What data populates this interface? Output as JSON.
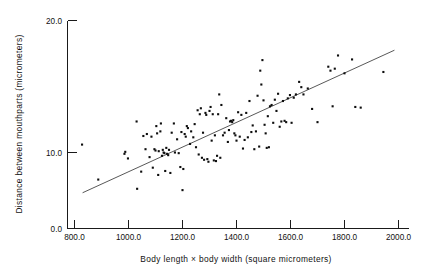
{
  "chart_data": {
    "type": "scatter",
    "title": "",
    "xlabel": "Body length × body width  (square micrometers)",
    "ylabel": "Distance between  mouthparts (micrometers)",
    "xlim": [
      740,
      2060
    ],
    "ylim": [
      0.0,
      20.0
    ],
    "grid": false,
    "legend": null,
    "xticks": [
      800.0,
      1000.0,
      1200.0,
      1400.0,
      1600.0,
      1800.0,
      2000.0
    ],
    "xtick_labels": [
      "800.0",
      "1000.0",
      "1200.0",
      "1400.0",
      "1600.0",
      "1800.0",
      "2000.0"
    ],
    "yticks": [
      0.0,
      10.0,
      20.0
    ],
    "ytick_labels": [
      "0.0",
      "10.0",
      "20.0"
    ],
    "marker": "small filled point",
    "marker_color": "#0d0d0d",
    "trendline": {
      "type": "linear-regression",
      "color": "#3a3a3a",
      "x_start": 830,
      "y_start": 6.95,
      "x_end": 1985,
      "y_end": 17.75
    },
    "points": [
      [
        828,
        10.6
      ],
      [
        888,
        7.95
      ],
      [
        985,
        9.9
      ],
      [
        988,
        10.05
      ],
      [
        998,
        9.55
      ],
      [
        1030,
        12.35
      ],
      [
        1032,
        7.25
      ],
      [
        1047,
        8.55
      ],
      [
        1055,
        11.25
      ],
      [
        1063,
        10.25
      ],
      [
        1068,
        11.4
      ],
      [
        1078,
        9.65
      ],
      [
        1085,
        11.2
      ],
      [
        1090,
        8.85
      ],
      [
        1096,
        10.25
      ],
      [
        1100,
        10.15
      ],
      [
        1103,
        12.0
      ],
      [
        1106,
        11.45
      ],
      [
        1110,
        8.3
      ],
      [
        1112,
        10.1
      ],
      [
        1118,
        11.6
      ],
      [
        1120,
        12.2
      ],
      [
        1124,
        9.75
      ],
      [
        1127,
        10.2
      ],
      [
        1130,
        10.0
      ],
      [
        1133,
        9.95
      ],
      [
        1136,
        8.6
      ],
      [
        1140,
        10.35
      ],
      [
        1143,
        9.9
      ],
      [
        1147,
        9.8
      ],
      [
        1150,
        10.2
      ],
      [
        1155,
        8.45
      ],
      [
        1160,
        11.5
      ],
      [
        1168,
        12.2
      ],
      [
        1172,
        10.0
      ],
      [
        1180,
        11.0
      ],
      [
        1186,
        9.95
      ],
      [
        1192,
        8.9
      ],
      [
        1196,
        11.55
      ],
      [
        1200,
        7.15
      ],
      [
        1203,
        8.75
      ],
      [
        1208,
        11.4
      ],
      [
        1212,
        11.2
      ],
      [
        1216,
        12.0
      ],
      [
        1220,
        11.85
      ],
      [
        1228,
        10.65
      ],
      [
        1232,
        11.6
      ],
      [
        1240,
        11.15
      ],
      [
        1245,
        12.15
      ],
      [
        1250,
        10.4
      ],
      [
        1256,
        13.2
      ],
      [
        1260,
        9.85
      ],
      [
        1264,
        12.9
      ],
      [
        1268,
        13.35
      ],
      [
        1272,
        9.6
      ],
      [
        1276,
        11.5
      ],
      [
        1280,
        9.45
      ],
      [
        1285,
        13.0
      ],
      [
        1288,
        12.85
      ],
      [
        1292,
        9.5
      ],
      [
        1296,
        9.3
      ],
      [
        1300,
        13.15
      ],
      [
        1304,
        13.45
      ],
      [
        1308,
        10.9
      ],
      [
        1312,
        12.9
      ],
      [
        1316,
        9.4
      ],
      [
        1320,
        11.3
      ],
      [
        1324,
        9.35
      ],
      [
        1328,
        9.75
      ],
      [
        1332,
        12.9
      ],
      [
        1336,
        14.4
      ],
      [
        1340,
        9.6
      ],
      [
        1344,
        13.6
      ],
      [
        1350,
        11.3
      ],
      [
        1356,
        11.5
      ],
      [
        1362,
        12.6
      ],
      [
        1368,
        10.8
      ],
      [
        1372,
        11.7
      ],
      [
        1376,
        12.35
      ],
      [
        1380,
        12.4
      ],
      [
        1384,
        12.3
      ],
      [
        1388,
        12.45
      ],
      [
        1392,
        11.45
      ],
      [
        1396,
        11.3
      ],
      [
        1400,
        10.9
      ],
      [
        1406,
        13.05
      ],
      [
        1412,
        11.2
      ],
      [
        1418,
        12.85
      ],
      [
        1424,
        10.3
      ],
      [
        1430,
        10.95
      ],
      [
        1436,
        13.0
      ],
      [
        1442,
        11.15
      ],
      [
        1448,
        13.9
      ],
      [
        1455,
        11.55
      ],
      [
        1460,
        12.05
      ],
      [
        1466,
        10.25
      ],
      [
        1472,
        11.6
      ],
      [
        1478,
        14.3
      ],
      [
        1484,
        10.45
      ],
      [
        1488,
        16.2
      ],
      [
        1492,
        15.15
      ],
      [
        1496,
        17.0
      ],
      [
        1500,
        13.95
      ],
      [
        1504,
        12.1
      ],
      [
        1508,
        11.45
      ],
      [
        1512,
        10.35
      ],
      [
        1516,
        12.75
      ],
      [
        1520,
        10.4
      ],
      [
        1524,
        13.5
      ],
      [
        1530,
        13.6
      ],
      [
        1536,
        12.25
      ],
      [
        1542,
        14.0
      ],
      [
        1548,
        13.15
      ],
      [
        1554,
        14.45
      ],
      [
        1560,
        11.95
      ],
      [
        1566,
        12.35
      ],
      [
        1572,
        13.9
      ],
      [
        1578,
        12.4
      ],
      [
        1584,
        12.3
      ],
      [
        1590,
        14.1
      ],
      [
        1598,
        14.35
      ],
      [
        1604,
        12.25
      ],
      [
        1612,
        14.15
      ],
      [
        1620,
        14.4
      ],
      [
        1632,
        15.35
      ],
      [
        1640,
        14.95
      ],
      [
        1648,
        14.4
      ],
      [
        1664,
        14.85
      ],
      [
        1680,
        13.3
      ],
      [
        1700,
        12.3
      ],
      [
        1740,
        16.5
      ],
      [
        1748,
        16.2
      ],
      [
        1756,
        13.5
      ],
      [
        1764,
        16.35
      ],
      [
        1776,
        17.35
      ],
      [
        1800,
        16.0
      ],
      [
        1828,
        17.05
      ],
      [
        1840,
        13.45
      ],
      [
        1860,
        13.4
      ],
      [
        1944,
        16.1
      ]
    ]
  },
  "axes": {
    "y_title": "Distance between  mouthparts (micrometers)",
    "x_title": "Body length × body width  (square micrometers)"
  }
}
